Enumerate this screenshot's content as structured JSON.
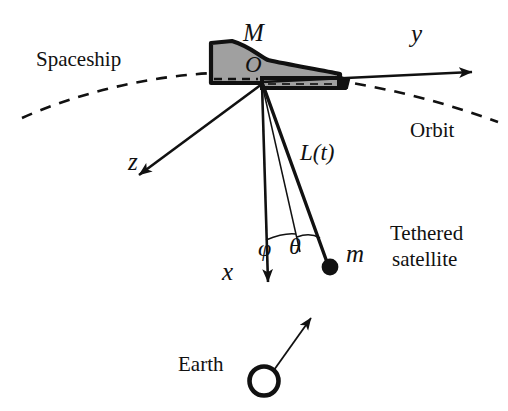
{
  "figure": {
    "background_color": "#ffffff",
    "stroke_color": "#111111",
    "spaceship_fill": "#a0a0a0"
  },
  "labels": {
    "spaceship": "Spaceship",
    "orbit": "Orbit",
    "earth": "Earth",
    "tethered_satellite_line1": "Tethered",
    "tethered_satellite_line2": "satellite",
    "mass_spaceship": "M",
    "mass_satellite": "m",
    "origin": "O",
    "axis_x": "x",
    "axis_y": "y",
    "axis_z": "z",
    "tether_length": "L(t)",
    "angle_phi": "φ",
    "angle_theta": "θ"
  },
  "icons": {
    "earth_marker": "earth-circle-icon",
    "satellite_marker": "satellite-dot-icon",
    "orbit_path": "dashed-orbit-curve-icon",
    "spaceship_body": "spaceship-silhouette-icon"
  },
  "geometry": {
    "origin_point": [
      262,
      82
    ],
    "axis_y_tip": [
      482,
      72
    ],
    "axis_z_tip": [
      131,
      181
    ],
    "axis_x_tip": [
      268,
      291
    ],
    "satellite_point": [
      330,
      267
    ],
    "earth_circle_center": [
      264,
      381
    ],
    "earth_circle_radius": 15,
    "phi_line_tip": [
      300,
      250
    ],
    "angle_phi_degrees": 9,
    "angle_theta_degrees": 8
  }
}
